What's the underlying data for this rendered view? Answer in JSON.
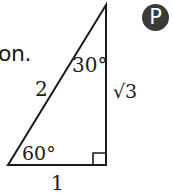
{
  "trailing_text": "on.",
  "badge_label": "P",
  "triangle": {
    "hypotenuse_label": "2",
    "vertical_leg_label": "√3",
    "horizontal_leg_label": "1",
    "top_angle_label": "30°",
    "bottom_angle_label": "60°",
    "right_angle_marker": true
  },
  "colors": {
    "line": "#1a1a1a",
    "badge_background": "#3a3a3a",
    "badge_text": "#ffffff"
  }
}
